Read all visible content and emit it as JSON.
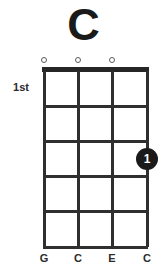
{
  "chord": {
    "name": "C",
    "instrument_strings": 4,
    "position_label": "1st",
    "fret_count": 5,
    "string_labels": [
      "G",
      "C",
      "E",
      "C"
    ],
    "open_markers": [
      {
        "string": 1,
        "symbol": "o",
        "icon": "open-string-circle-icon"
      },
      {
        "string": 2,
        "symbol": "o",
        "icon": "open-string-circle-icon"
      },
      {
        "string": 3,
        "symbol": "o",
        "icon": "open-string-circle-icon"
      }
    ],
    "muted_markers": [],
    "finger_dots": [
      {
        "string": 4,
        "fret": 3,
        "finger": "1"
      }
    ],
    "colors": {
      "background": "#ffffff",
      "title": "#1a1a1a",
      "grid": "#2f2f2f",
      "nut": "#262626",
      "dot_fill": "#1a1a1a",
      "dot_text": "#ffffff",
      "marker_outline": "#5a5a5a",
      "label_text": "#2b2b2b"
    },
    "geometry": {
      "grid_left": 44,
      "grid_right": 147,
      "grid_top": 71,
      "grid_bottom": 247,
      "string_x": [
        44,
        78,
        112,
        147
      ],
      "fret_y": [
        106,
        141,
        176,
        211,
        247
      ]
    }
  }
}
